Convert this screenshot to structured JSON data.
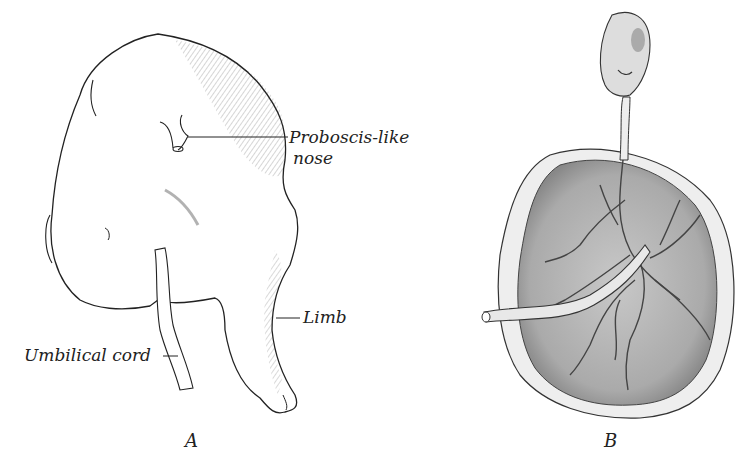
{
  "figure": {
    "panels": [
      {
        "id": "A",
        "caption": "A",
        "labels": {
          "nose": "Proboscis-like",
          "nose_line2": "nose",
          "limb": "Limb",
          "cord": "Umbilical cord"
        }
      },
      {
        "id": "B",
        "caption": "B"
      }
    ],
    "colors": {
      "ink": "#222222",
      "placenta_fill": "#b9b9b9",
      "background": "#ffffff"
    }
  }
}
